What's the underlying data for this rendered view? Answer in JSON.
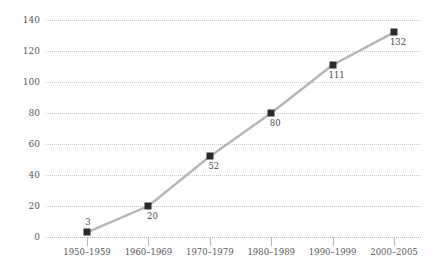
{
  "chart_data": {
    "type": "line",
    "title": "",
    "subtitle": "",
    "xlabel": "",
    "ylabel": "",
    "categories": [
      "1950–1959",
      "1960–1969",
      "1970–1979",
      "1980–1989",
      "1990–1999",
      "2000–2005"
    ],
    "values": [
      3,
      20,
      52,
      80,
      111,
      132
    ],
    "point_labels": [
      "3",
      "20",
      "52",
      "80",
      "111",
      "132"
    ],
    "ylim": [
      0,
      140
    ],
    "ytick_values": [
      0,
      20,
      40,
      60,
      80,
      100,
      120,
      140
    ],
    "ytick_labels": [
      "0",
      "20",
      "40",
      "60",
      "80",
      "100",
      "120",
      "140"
    ],
    "grid": "horizontal-dotted",
    "legend": "none",
    "series": [
      {
        "name": "",
        "values": [
          3,
          20,
          52,
          80,
          111,
          132
        ]
      }
    ],
    "colors": {
      "line": "#b5b5b5",
      "marker": "#2b2b2b",
      "grid": "#c9c9c9",
      "text": "#5a5a5a",
      "background": "#ffffff"
    }
  }
}
